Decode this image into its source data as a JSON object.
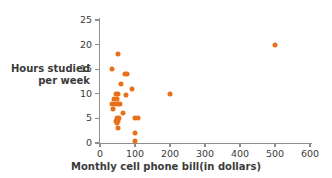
{
  "chart_data": {
    "type": "scatter",
    "title": "",
    "xlabel": "Monthly cell phone bill(in dollars)",
    "ylabel_line1": "Hours studied",
    "ylabel_line2": "per week",
    "ylabel": "Hours studied per week",
    "xlim": [
      0,
      600
    ],
    "ylim": [
      0,
      25
    ],
    "xticks": [
      0,
      100,
      200,
      300,
      400,
      500,
      600
    ],
    "yticks": [
      0,
      5,
      10,
      15,
      20,
      25
    ],
    "grid": false,
    "legend": "none",
    "marker_color": "#e8701a",
    "axis_color": "#8f8f8f",
    "text_color": "#3b3b3b",
    "points": [
      {
        "x": 50,
        "y": 18
      },
      {
        "x": 35,
        "y": 15
      },
      {
        "x": 70,
        "y": 14
      },
      {
        "x": 78,
        "y": 14
      },
      {
        "x": 60,
        "y": 12
      },
      {
        "x": 90,
        "y": 11
      },
      {
        "x": 45,
        "y": 10
      },
      {
        "x": 50,
        "y": 10
      },
      {
        "x": 75,
        "y": 9.8
      },
      {
        "x": 40,
        "y": 9
      },
      {
        "x": 48,
        "y": 9
      },
      {
        "x": 35,
        "y": 8
      },
      {
        "x": 42,
        "y": 8
      },
      {
        "x": 50,
        "y": 8
      },
      {
        "x": 58,
        "y": 8
      },
      {
        "x": 38,
        "y": 7
      },
      {
        "x": 65,
        "y": 6
      },
      {
        "x": 48,
        "y": 5
      },
      {
        "x": 55,
        "y": 5
      },
      {
        "x": 100,
        "y": 5
      },
      {
        "x": 108,
        "y": 5
      },
      {
        "x": 45,
        "y": 4.5
      },
      {
        "x": 52,
        "y": 4.5
      },
      {
        "x": 48,
        "y": 4
      },
      {
        "x": 50,
        "y": 3
      },
      {
        "x": 100,
        "y": 2
      },
      {
        "x": 100,
        "y": 0.5
      },
      {
        "x": 200,
        "y": 10
      },
      {
        "x": 500,
        "y": 20
      }
    ]
  }
}
